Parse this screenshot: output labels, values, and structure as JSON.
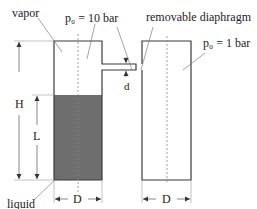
{
  "labels": {
    "vapor": "vapor",
    "liquid": "liquid",
    "left_pressure": "p₀ = 10 bar",
    "right_pressure": "p₀ = 1 bar",
    "diaphragm": "removable diaphragm",
    "H": "H",
    "L": "L",
    "d": "d",
    "D_left": "D",
    "D_right": "D"
  },
  "colors": {
    "outline": "#3a3a3a",
    "liquid_fill": "#6e6e6e",
    "dim_line": "#555555",
    "centerline": "#888888"
  }
}
